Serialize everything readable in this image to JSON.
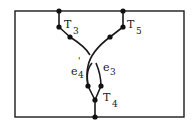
{
  "diagram": {
    "type": "graph-embedding",
    "labels": {
      "T3": {
        "base": "T",
        "sub": "3"
      },
      "T5": {
        "base": "T",
        "sub": "5"
      },
      "T4": {
        "base": "T",
        "sub": "4"
      },
      "e4prime": {
        "base": "e",
        "prime": "'",
        "sub": "4"
      },
      "e3": {
        "base": "e",
        "sub": "3"
      }
    },
    "colors": {
      "ink": "#1a1a1a",
      "background": "#ffffff"
    }
  }
}
